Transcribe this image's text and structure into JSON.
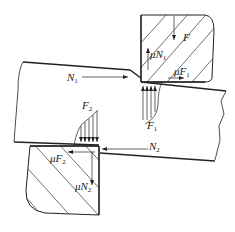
{
  "diagram": {
    "type": "shearing force diagram",
    "stroke_color": "#222222",
    "background": "#ffffff",
    "labels": {
      "F": {
        "main": "F",
        "sub": ""
      },
      "muN1": {
        "main": "μN",
        "sub": "1"
      },
      "muF1": {
        "main": "μF",
        "sub": "1"
      },
      "N1": {
        "main": "N",
        "sub": "1"
      },
      "F1": {
        "main": "F",
        "sub": "1"
      },
      "F2": {
        "main": "F",
        "sub": "2"
      },
      "N2": {
        "main": "N",
        "sub": "2"
      },
      "muF2": {
        "main": "μF",
        "sub": "2"
      },
      "muN2": {
        "main": "μN",
        "sub": "2"
      }
    },
    "components": [
      "upper-blade",
      "lower-blade",
      "sheet-workpiece",
      "pressure-distribution-F1",
      "pressure-distribution-F2"
    ]
  }
}
